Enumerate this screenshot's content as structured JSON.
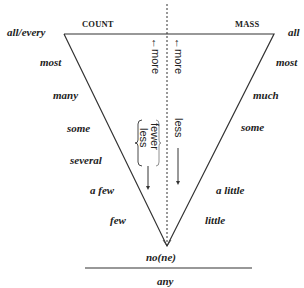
{
  "diagram": {
    "headers": {
      "count": "COUNT",
      "mass": "MASS"
    },
    "count_quantifiers": [
      "all/every",
      "most",
      "many",
      "some",
      "several",
      "a few",
      "few"
    ],
    "mass_quantifiers": [
      "all",
      "most",
      "much",
      "some",
      "a little",
      "little"
    ],
    "apex": "no(ne)",
    "below_line": "any",
    "axis_labels": {
      "count_more": "←more",
      "mass_more": "←more",
      "count_fewer": "fewer",
      "count_less": "less",
      "mass_less": "less"
    },
    "colors": {
      "ink": "#222222",
      "background": "#ffffff"
    }
  }
}
